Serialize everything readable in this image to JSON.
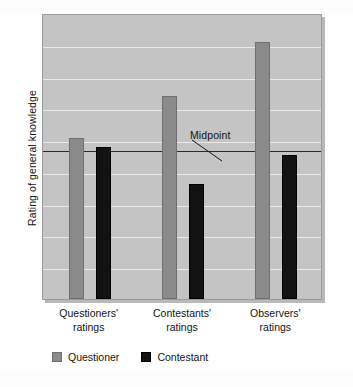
{
  "chart_data": {
    "type": "bar",
    "title": "",
    "subtitle": "",
    "xlabel": "",
    "ylabel": "Rating of general knowledge",
    "categories": [
      "Questioners' ratings",
      "Contestants' ratings",
      "Observers' ratings"
    ],
    "category_lines": [
      {
        "line1": "Questioners'",
        "line2": "ratings"
      },
      {
        "line1": "Contestants'",
        "line2": "ratings"
      },
      {
        "line1": "Observers'",
        "line2": "ratings"
      }
    ],
    "series": [
      {
        "name": "Questioner",
        "color": "#8a8a8a",
        "values": [
          0.086,
          0.407,
          0.821
        ]
      },
      {
        "name": "Contestant",
        "color": "#121212",
        "values": [
          0.021,
          -0.264,
          -0.043
        ]
      }
    ],
    "ylim": [
      -1.143,
      1.043
    ],
    "y_reference_lines": [
      {
        "label": "Midpoint",
        "value": 0
      }
    ],
    "gridlines": true,
    "grid_count": 8,
    "legend_position": "bottom-left",
    "tick_labels": [],
    "annotations": [
      {
        "text": "Midpoint",
        "points_to": "midpoint reference line"
      }
    ]
  },
  "legend": {
    "items": [
      {
        "label": "Questioner",
        "swatch": "gray-square-swatch"
      },
      {
        "label": "Contestant",
        "swatch": "black-square-swatch"
      }
    ]
  },
  "annotation": {
    "midpoint_label": "Midpoint"
  },
  "axes": {
    "y_title": "Rating of general knowledge"
  },
  "colors": {
    "plot_background": "#c4c4c4",
    "gridline": "#eaeaea",
    "midpoint_line": "#2b2b2b",
    "questioner_bar": "#8a8a8a",
    "contestant_bar": "#121212",
    "page_background": "#ffffff"
  }
}
